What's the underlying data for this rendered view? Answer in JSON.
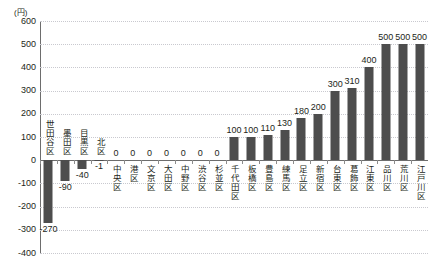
{
  "chart_data": {
    "type": "bar",
    "title": "",
    "subtitle": "",
    "xlabel": "",
    "ylabel": "",
    "unit_label": "(円)",
    "ylim": [
      -400,
      600
    ],
    "ytick_step": 100,
    "yticks": [
      "600",
      "500",
      "400",
      "300",
      "200",
      "100",
      "0",
      "-100",
      "-200",
      "-300",
      "-400"
    ],
    "grid": true,
    "legend": "none",
    "bar_color": "#4d4d4d",
    "categories": [
      "世田谷区",
      "墨田区",
      "目黒区",
      "北区",
      "中央区",
      "港区",
      "文京区",
      "大田区",
      "中野区",
      "渋谷区",
      "杉並区",
      "千代田区",
      "板橋区",
      "豊島区",
      "練馬区",
      "足立区",
      "新宿区",
      "台東区",
      "葛飾区",
      "江東区",
      "品川区",
      "荒川区",
      "江戸川区"
    ],
    "values": [
      -270,
      -90,
      -40,
      -1,
      0,
      0,
      0,
      0,
      0,
      0,
      0,
      100,
      100,
      110,
      130,
      180,
      200,
      300,
      310,
      400,
      500,
      500,
      500
    ],
    "value_labels": [
      "-270",
      "-90",
      "-40",
      "-1",
      "0",
      "0",
      "0",
      "0",
      "0",
      "0",
      "0",
      "100",
      "100",
      "110",
      "130",
      "180",
      "200",
      "300",
      "310",
      "400",
      "500",
      "500",
      "500"
    ]
  }
}
